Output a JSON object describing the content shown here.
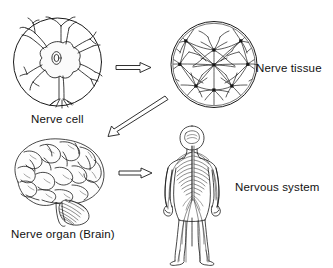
{
  "figure": {
    "background_color": "#ffffff",
    "ink_color": "#1a1a1a",
    "width": 333,
    "height": 268
  },
  "labels": {
    "nerve_cell": "Nerve cell",
    "nerve_tissue": "Nerve tissue",
    "nerve_organ": "Nerve organ (Brain)",
    "nervous_system": "Nervous system"
  },
  "nodes": [
    {
      "id": "nerve-cell",
      "label": "Nerve cell",
      "illustration": "neuron-in-circle",
      "shape": "circle",
      "x": 13,
      "y": 18,
      "width": 89,
      "height": 88
    },
    {
      "id": "nerve-tissue",
      "label": "Nerve tissue",
      "illustration": "nerve-tissue-in-circle",
      "shape": "circle",
      "x": 171,
      "y": 21,
      "width": 86,
      "height": 87
    },
    {
      "id": "nerve-organ",
      "label": "Nerve organ (Brain)",
      "illustration": "human-brain",
      "shape": "free",
      "x": 10,
      "y": 139,
      "width": 97,
      "height": 88
    },
    {
      "id": "nervous-system",
      "label": "Nervous system",
      "illustration": "human-body-nervous-system",
      "shape": "free",
      "x": 164,
      "y": 124,
      "width": 74,
      "height": 138
    }
  ],
  "arrows": [
    {
      "id": "arrow-cell-to-tissue",
      "from": "nerve-cell",
      "to": "nerve-tissue",
      "style": "hollow-outline",
      "direction": "right"
    },
    {
      "id": "arrow-tissue-to-organ",
      "from": "nerve-tissue",
      "to": "nerve-organ",
      "style": "hollow-outline",
      "direction": "down-left"
    },
    {
      "id": "arrow-organ-to-system",
      "from": "nerve-organ",
      "to": "nervous-system",
      "style": "hollow-outline",
      "direction": "right"
    }
  ]
}
